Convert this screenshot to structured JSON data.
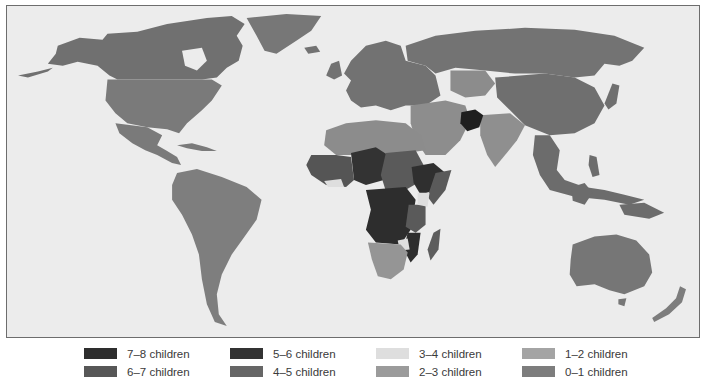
{
  "map": {
    "type": "choropleth",
    "subject": "Fertility rate (children per woman) by country",
    "background_color": "#ececec",
    "border_color": "#6d6d6d"
  },
  "legend": {
    "items": [
      {
        "label": "7–8 children",
        "color": "#2e2e2e",
        "col": 0,
        "row": 0
      },
      {
        "label": "6–7 children",
        "color": "#575757",
        "col": 0,
        "row": 1
      },
      {
        "label": "5–6 children",
        "color": "#333333",
        "col": 1,
        "row": 0
      },
      {
        "label": "4–5 children",
        "color": "#666666",
        "col": 1,
        "row": 1
      },
      {
        "label": "3–4 children",
        "color": "#dedede",
        "col": 2,
        "row": 0
      },
      {
        "label": "2–3 children",
        "color": "#9b9b9b",
        "col": 2,
        "row": 1
      },
      {
        "label": "1–2 children",
        "color": "#a4a4a4",
        "col": 3,
        "row": 0
      },
      {
        "label": "0–1 children",
        "color": "#7d7d7d",
        "col": 3,
        "row": 1
      }
    ]
  },
  "regions": {
    "north_america": "#707070",
    "usa": "#7a7a7a",
    "central_america": "#7a7a7a",
    "south_america": "#7e7e7e",
    "greenland": "#777777",
    "europe": "#727272",
    "russia": "#737373",
    "central_asia": "#8c8c8c",
    "china": "#6f6f6f",
    "india": "#8f8f8f",
    "middle_east": "#8d8d8d",
    "north_africa": "#8c8c8c",
    "west_africa": "#555555",
    "sahel": "#333333",
    "central_africa": "#2d2d2d",
    "east_africa": "#5a5a5a",
    "horn": "#2f2f2f",
    "southern_africa": "#959595",
    "madagascar": "#5d5d5d",
    "afghanistan": "#1f1f1f",
    "southeast_asia": "#6c6c6c",
    "australia": "#767676",
    "new_zealand": "#7d7d7d"
  }
}
